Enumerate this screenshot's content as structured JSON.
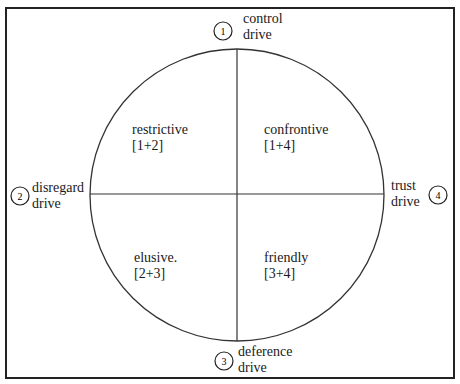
{
  "diagram": {
    "title": "",
    "frame": {
      "x": 6,
      "y": 8,
      "width": 448,
      "height": 370
    },
    "circle": {
      "cx": 237,
      "cy": 195,
      "rx": 147,
      "ry": 146
    },
    "colors": {
      "line": "#222222",
      "text": "#1a1a1a",
      "background": "#ffffff"
    },
    "drives": [
      {
        "id": "1",
        "number": "1",
        "line1": "control",
        "line2": "drive",
        "position": "top"
      },
      {
        "id": "2",
        "number": "2",
        "line1": "disregard",
        "line2": "drive",
        "position": "left"
      },
      {
        "id": "3",
        "number": "3",
        "line1": "deference",
        "line2": "drive",
        "position": "bottom"
      },
      {
        "id": "4",
        "number": "4",
        "line1": "trust",
        "line2": "drive",
        "position": "right"
      }
    ],
    "quadrants": [
      {
        "name": "restrictive",
        "combo": "[1+2]",
        "position": "top-left"
      },
      {
        "name": "confrontive",
        "combo": "[1+4]",
        "position": "top-right"
      },
      {
        "name": "elusive.",
        "combo": "[2+3]",
        "position": "bottom-left"
      },
      {
        "name": "friendly",
        "combo": "[3+4]",
        "position": "bottom-right"
      }
    ]
  }
}
